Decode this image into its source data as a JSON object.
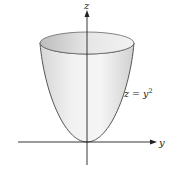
{
  "figure": {
    "surface_label": "z = y",
    "surface_exponent": "2",
    "axes": {
      "vertical_label": "z",
      "horizontal_label": "y"
    },
    "colors": {
      "surface_fill_light": "#f4f4f4",
      "surface_fill_dark": "#cfcfcf",
      "outline": "#555555",
      "axis": "#222222"
    }
  }
}
